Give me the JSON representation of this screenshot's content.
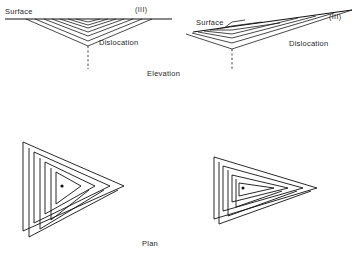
{
  "figure": {
    "title_elevation": "Elevation",
    "title_plan": "Plan",
    "background_color": "#ffffff",
    "line_color": "#111111"
  },
  "elevation_left": {
    "surface_label": "Surface",
    "plane_index_label": "(III)",
    "dislocation_label": "Dislocation",
    "surface_line": {
      "x1": 5,
      "y1": 19,
      "x2": 172,
      "y2": 19,
      "tilted": false
    },
    "dislocation_line": {
      "x1": 88,
      "y1": 47,
      "x2": 88,
      "y2": 68,
      "style": "dashed"
    },
    "apex": {
      "x": 88,
      "y": 47
    },
    "step_count": 7,
    "steps": [
      {
        "left_x": 76,
        "right_x": 100,
        "apex_y": 22
      },
      {
        "left_x": 68,
        "right_x": 108,
        "apex_y": 26
      },
      {
        "left_x": 60,
        "right_x": 116,
        "apex_y": 30
      },
      {
        "left_x": 52,
        "right_x": 124,
        "apex_y": 34
      },
      {
        "left_x": 44,
        "right_x": 132,
        "apex_y": 38
      },
      {
        "left_x": 35,
        "right_x": 142,
        "apex_y": 42
      },
      {
        "left_x": 26,
        "right_x": 152,
        "apex_y": 46
      }
    ]
  },
  "elevation_right": {
    "surface_label": "Surface",
    "plane_index_label": "(III)",
    "dislocation_label": "Dislocation",
    "surface_line": {
      "x1": 193,
      "y1": 32,
      "x2": 352,
      "y2": 10,
      "tilted": true
    },
    "dislocation_line": {
      "x1": 232,
      "y1": 50,
      "x2": 232,
      "y2": 70,
      "style": "dashed"
    },
    "apex": {
      "x": 232,
      "y": 50
    },
    "step_count": 7,
    "steps": [
      {
        "left_x": 223,
        "right_x": 243,
        "apex_y": 23
      },
      {
        "left_x": 216,
        "right_x": 258,
        "apex_y": 27
      },
      {
        "left_x": 209,
        "right_x": 275,
        "apex_y": 31
      },
      {
        "left_x": 202,
        "right_x": 292,
        "apex_y": 35
      },
      {
        "left_x": 196,
        "right_x": 309,
        "apex_y": 39
      },
      {
        "left_x": 190,
        "right_x": 327,
        "apex_y": 44
      },
      {
        "left_x": 184,
        "right_x": 345,
        "apex_y": 48
      }
    ]
  },
  "plan_left": {
    "shape": "triangular-growth-spiral",
    "turn_count": 5,
    "center_dot": {
      "x": 62,
      "y": 186
    },
    "description": "equilateral triangular spiral, apex pointing right"
  },
  "plan_right": {
    "shape": "triangular-growth-spiral",
    "turn_count": 5,
    "center_dot": {
      "x": 242,
      "y": 188
    },
    "description": "elongated triangular spiral, apex pointing right"
  }
}
